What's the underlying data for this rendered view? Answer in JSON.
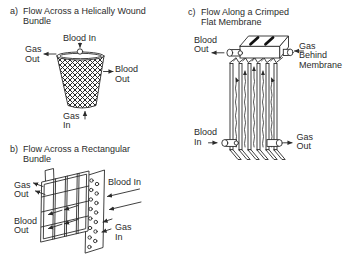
{
  "figure": {
    "background": "#ffffff",
    "ink": "#2b2b2b"
  },
  "panel_a": {
    "marker": "a)",
    "title": "Flow Across a Helically Wound\nBundle",
    "labels": {
      "blood_in": "Blood In",
      "gas_out": "Gas\nOut",
      "blood_out": "Blood\nOut",
      "gas_in": "Gas\nIn"
    }
  },
  "panel_b": {
    "marker": "b)",
    "title": "Flow Across a Rectangular\nBundle",
    "labels": {
      "gas_out": "Gas\nOut",
      "blood_out": "Blood\nOut",
      "blood_in": "Blood In",
      "gas_in": "Gas\nIn"
    }
  },
  "panel_c": {
    "marker": "c)",
    "title": "Flow Along a Crimped\nFlat Membrane",
    "labels": {
      "blood_out": "Blood\nOut",
      "gas_behind_membrane": "Gas Behind\nMembrane",
      "blood_in": "Blood\nIn",
      "gas_out": "Gas\nOut"
    }
  }
}
